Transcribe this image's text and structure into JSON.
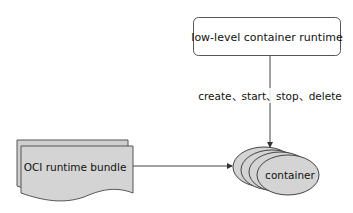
{
  "diagram": {
    "runtime_box": {
      "label": "low-level container runtime"
    },
    "operations_label": "create、start、stop、delete",
    "bundle": {
      "label": "OCI runtime bundle"
    },
    "container": {
      "label": "container"
    },
    "colors": {
      "stroke": "#555555",
      "box_fill": "#ffffff",
      "shape_fill": "#d4d4d4",
      "text": "#111111"
    }
  }
}
